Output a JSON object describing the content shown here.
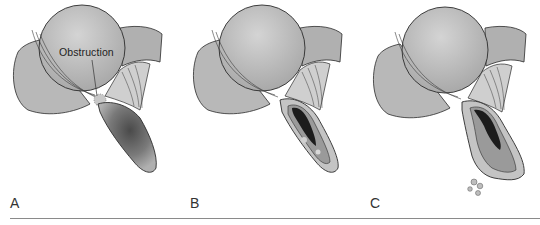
{
  "figure": {
    "panels": [
      {
        "label": "A",
        "annotation": "Obstruction",
        "stage": "obstructed-distended"
      },
      {
        "label": "B",
        "stage": "inflamed-lumen"
      },
      {
        "label": "C",
        "stage": "perforated"
      }
    ],
    "colors": {
      "tissue_fill": "#b4b4b4",
      "tissue_light": "#cfcfcf",
      "outline": "#2b2b2b",
      "lumen_dark": "#1c1c1c",
      "baseline": "#8a8a8a"
    }
  }
}
